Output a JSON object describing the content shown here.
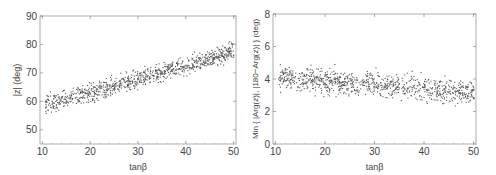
{
  "chart_data": [
    {
      "type": "scatter",
      "title": "",
      "xlabel": "tanβ",
      "ylabel": "|z| (deg)",
      "xlim": [
        9.5,
        50.5
      ],
      "ylim": [
        45,
        90
      ],
      "xticks": [
        10,
        20,
        30,
        40,
        50
      ],
      "yticks": [
        50,
        60,
        70,
        80,
        90
      ],
      "grid": false,
      "legend": null,
      "trend": {
        "x": [
          10,
          20,
          30,
          40,
          50
        ],
        "y_center": [
          59,
          63,
          68,
          73,
          78
        ],
        "spread": 3
      },
      "series": [
        {
          "name": "points",
          "n_points": 900,
          "color": "#555555"
        }
      ]
    },
    {
      "type": "scatter",
      "title": "",
      "xlabel": "tanβ",
      "ylabel": "Min { |Arg(z)|, |180−Arg(z)| } (deg)",
      "xlim": [
        9.5,
        50.5
      ],
      "ylim": [
        0,
        8
      ],
      "xticks": [
        10,
        20,
        30,
        40,
        50
      ],
      "yticks": [
        0,
        2,
        4,
        6,
        8
      ],
      "grid": false,
      "legend": null,
      "trend": {
        "x": [
          10,
          20,
          30,
          40,
          50
        ],
        "y_center": [
          4.1,
          3.9,
          3.7,
          3.4,
          3.2
        ],
        "spread": 0.7
      },
      "series": [
        {
          "name": "points",
          "n_points": 900,
          "color": "#555555"
        }
      ]
    }
  ]
}
